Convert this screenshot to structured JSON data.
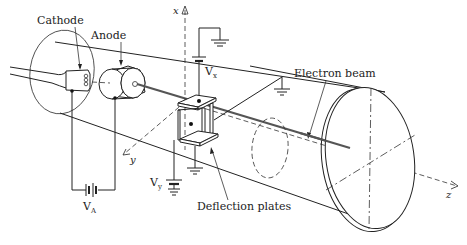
{
  "diagram": {
    "labels": {
      "cathode": "Cathode",
      "anode": "Anode",
      "electron_beam": "Electron beam",
      "deflection_plates": "Deflection plates",
      "vx_main": "V",
      "vx_sub": "x",
      "vy_main": "V",
      "vy_sub": "y",
      "va_main": "V",
      "va_sub": "A"
    },
    "axes": {
      "x": "x",
      "y": "y",
      "z": "z"
    },
    "components": [
      {
        "id": "cathode",
        "label": "Cathode"
      },
      {
        "id": "anode",
        "label": "Anode"
      },
      {
        "id": "deflection-plates",
        "label": "Deflection plates"
      },
      {
        "id": "electron-beam",
        "label": "Electron beam"
      },
      {
        "id": "battery-va",
        "label": "V_A"
      },
      {
        "id": "battery-vx",
        "label": "V_x"
      },
      {
        "id": "battery-vy",
        "label": "V_y"
      },
      {
        "id": "screen",
        "label": ""
      }
    ],
    "colors": {
      "line": "#222222",
      "beam": "#555555",
      "background": "#ffffff"
    }
  }
}
